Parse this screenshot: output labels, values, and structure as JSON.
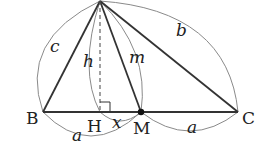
{
  "diagram": {
    "points": {
      "B": {
        "label": "B",
        "x": 43,
        "y": 112
      },
      "C": {
        "label": "C",
        "x": 238,
        "y": 112
      },
      "A": {
        "label": "",
        "x": 100,
        "y": 1
      },
      "H": {
        "label": "H",
        "x": 100,
        "y": 112
      },
      "M": {
        "label": "M",
        "x": 141,
        "y": 112
      }
    },
    "segment_labels": {
      "c": "c",
      "b": "b",
      "h": "h",
      "m": "m",
      "x": "x",
      "a_left": "a",
      "a_right": "a"
    },
    "colors": {
      "edge": "#333333",
      "arc": "#8a8a8a",
      "dot": "#111111"
    }
  }
}
